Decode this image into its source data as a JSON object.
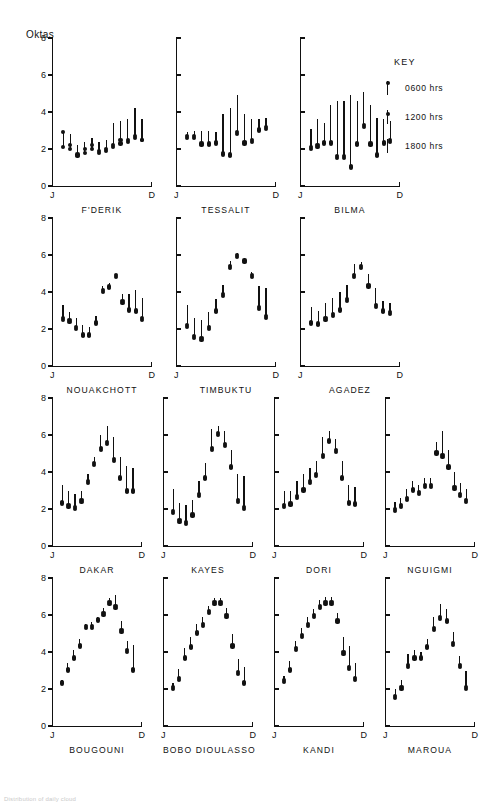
{
  "figure": {
    "y_axis_title": "Oktas",
    "caption": "Distribution of daily cloud"
  },
  "key": {
    "title": "KEY",
    "items": [
      {
        "label": "0600 hrs",
        "marker": "dot-top-of-line",
        "dot_pos": 0.05
      },
      {
        "label": "1200 hrs",
        "marker": "dot-upper-line",
        "dot_pos": 0.22
      },
      {
        "label": "1800 hrs",
        "marker": "plain-line",
        "dot_pos": null
      }
    ]
  },
  "chart_data": {
    "type": "line",
    "ylabel": "Oktas",
    "xlabel": "",
    "ylim": [
      0,
      8
    ],
    "yticks": [
      0,
      2,
      4,
      6,
      8
    ],
    "ytick_labels": [
      "0",
      "2",
      "4",
      "6",
      "8"
    ],
    "xticks": [
      "J",
      "D"
    ],
    "xtick_labels": [
      "J",
      "D"
    ],
    "grid": false,
    "legend_position": "top-right",
    "categories": [
      "J",
      "F",
      "M",
      "A",
      "M",
      "J",
      "J",
      "A",
      "S",
      "O",
      "N",
      "D"
    ],
    "series_names": [
      "0600 hrs",
      "1200 hrs",
      "1800 hrs"
    ],
    "panels": [
      {
        "name": "F'DERIK",
        "row": 0,
        "col": 0,
        "series": [
          {
            "name": "0600 hrs",
            "values": [
              2.9,
              2.0,
              1.6,
              1.8,
              2.0,
              1.8,
              1.9,
              2.1,
              2.3,
              2.4,
              2.6,
              2.5
            ]
          },
          {
            "name": "1200 hrs",
            "values": [
              2.1,
              2.2,
              1.7,
              2.0,
              2.2,
              1.9,
              2.0,
              2.2,
              2.5,
              2.5,
              2.7,
              2.5
            ]
          },
          {
            "name": "1800 hrs",
            "values": [
              3.0,
              2.8,
              2.2,
              2.4,
              2.6,
              2.4,
              2.5,
              3.4,
              3.5,
              3.6,
              4.2,
              3.6
            ]
          }
        ]
      },
      {
        "name": "TESSALIT",
        "row": 0,
        "col": 1,
        "series": [
          {
            "name": "0600 hrs",
            "values": [
              2.6,
              2.6,
              2.2,
              2.2,
              2.3,
              1.7,
              1.6,
              2.8,
              2.3,
              2.4,
              3.0,
              3.1
            ]
          },
          {
            "name": "1200 hrs",
            "values": [
              2.7,
              2.7,
              2.3,
              2.3,
              2.4,
              1.8,
              1.7,
              2.9,
              2.4,
              2.5,
              3.1,
              3.2
            ]
          },
          {
            "name": "1800 hrs",
            "values": [
              2.9,
              3.0,
              3.0,
              3.0,
              2.9,
              3.9,
              4.2,
              4.9,
              3.9,
              3.6,
              3.6,
              3.7
            ]
          }
        ]
      },
      {
        "name": "BILMA",
        "row": 0,
        "col": 2,
        "series": [
          {
            "name": "0600 hrs",
            "values": [
              2.0,
              2.1,
              2.3,
              2.3,
              1.5,
              1.5,
              1.0,
              2.2,
              3.2,
              2.2,
              1.6,
              2.3,
              2.4
            ]
          },
          {
            "name": "1200 hrs",
            "values": [
              2.1,
              2.2,
              2.4,
              2.4,
              1.6,
              1.6,
              1.1,
              2.3,
              3.3,
              2.3,
              1.7,
              2.4,
              2.5
            ]
          },
          {
            "name": "1800 hrs",
            "values": [
              3.1,
              3.6,
              3.4,
              4.4,
              4.6,
              4.6,
              4.9,
              4.6,
              5.1,
              4.4,
              3.7,
              3.6,
              3.5
            ]
          }
        ]
      },
      {
        "name": "NOUAKCHOTT",
        "row": 1,
        "col": 0,
        "series": [
          {
            "name": "0600 hrs",
            "values": [
              2.5,
              2.4,
              2.0,
              1.6,
              1.6,
              2.3,
              4.0,
              4.2,
              4.8,
              3.4,
              3.0,
              2.9,
              2.5
            ]
          },
          {
            "name": "1200 hrs",
            "values": [
              2.6,
              2.5,
              2.1,
              1.7,
              1.7,
              2.4,
              4.1,
              4.3,
              4.9,
              3.5,
              3.1,
              3.0,
              2.6
            ]
          },
          {
            "name": "1800 hrs",
            "values": [
              3.3,
              2.9,
              2.6,
              2.2,
              2.1,
              2.7,
              4.3,
              4.5,
              4.9,
              3.9,
              3.9,
              4.1,
              3.7
            ]
          }
        ]
      },
      {
        "name": "TIMBUKTU",
        "row": 1,
        "col": 1,
        "series": [
          {
            "name": "0600 hrs",
            "values": [
              2.1,
              1.5,
              1.4,
              2.0,
              2.9,
              3.8,
              5.3,
              5.9,
              5.6,
              4.8,
              3.1,
              2.6
            ]
          },
          {
            "name": "1200 hrs",
            "values": [
              2.2,
              1.6,
              1.5,
              2.1,
              3.0,
              3.9,
              5.4,
              6.0,
              5.7,
              4.9,
              3.2,
              2.7
            ]
          },
          {
            "name": "1800 hrs",
            "values": [
              3.3,
              2.6,
              2.5,
              2.9,
              3.6,
              4.4,
              5.7,
              6.1,
              5.8,
              5.1,
              4.3,
              4.2
            ]
          }
        ]
      },
      {
        "name": "AGADEZ",
        "row": 1,
        "col": 2,
        "series": [
          {
            "name": "0600 hrs",
            "values": [
              2.3,
              2.2,
              2.5,
              2.7,
              3.0,
              3.5,
              4.8,
              5.3,
              4.3,
              3.2,
              2.9,
              2.8
            ]
          },
          {
            "name": "1200 hrs",
            "values": [
              2.4,
              2.3,
              2.6,
              2.8,
              3.1,
              3.6,
              4.9,
              5.4,
              4.4,
              3.3,
              3.0,
              2.9
            ]
          },
          {
            "name": "1800 hrs",
            "values": [
              3.2,
              3.0,
              3.4,
              3.7,
              4.0,
              4.4,
              5.5,
              5.6,
              5.0,
              4.2,
              3.5,
              3.4
            ]
          }
        ]
      },
      {
        "name": "DAKAR",
        "row": 2,
        "col": 0,
        "series": [
          {
            "name": "0600 hrs",
            "values": [
              2.3,
              2.1,
              2.0,
              2.4,
              3.4,
              4.4,
              5.2,
              5.5,
              4.6,
              3.6,
              2.9,
              2.9
            ]
          },
          {
            "name": "1200 hrs",
            "values": [
              2.4,
              2.2,
              2.1,
              2.5,
              3.5,
              4.5,
              5.3,
              5.6,
              4.7,
              3.7,
              3.0,
              3.0
            ]
          },
          {
            "name": "1800 hrs",
            "values": [
              3.3,
              3.0,
              2.8,
              3.0,
              3.9,
              4.8,
              6.0,
              6.5,
              5.9,
              4.8,
              4.3,
              4.2
            ]
          }
        ]
      },
      {
        "name": "KAYES",
        "row": 2,
        "col": 1,
        "series": [
          {
            "name": "0600 hrs",
            "values": [
              1.8,
              1.3,
              1.2,
              1.6,
              2.7,
              3.6,
              5.2,
              6.0,
              5.4,
              4.2,
              2.4,
              2.0
            ]
          },
          {
            "name": "1200 hrs",
            "values": [
              1.9,
              1.4,
              1.3,
              1.7,
              2.8,
              3.7,
              5.3,
              6.1,
              5.5,
              4.3,
              2.5,
              2.1
            ]
          },
          {
            "name": "1800 hrs",
            "values": [
              3.1,
              2.3,
              2.2,
              2.5,
              3.5,
              4.5,
              6.3,
              6.5,
              6.2,
              5.2,
              3.9,
              3.8
            ]
          }
        ]
      },
      {
        "name": "DORI",
        "row": 2,
        "col": 2,
        "series": [
          {
            "name": "0600 hrs",
            "values": [
              2.1,
              2.2,
              2.6,
              3.0,
              3.4,
              3.8,
              4.8,
              5.6,
              5.1,
              3.6,
              2.3,
              2.2
            ]
          },
          {
            "name": "1200 hrs",
            "values": [
              2.2,
              2.3,
              2.7,
              3.1,
              3.5,
              3.9,
              4.9,
              5.7,
              5.2,
              3.7,
              2.4,
              2.3
            ]
          },
          {
            "name": "1800 hrs",
            "values": [
              3.0,
              3.0,
              3.5,
              3.9,
              4.2,
              4.6,
              5.9,
              6.2,
              5.8,
              4.6,
              3.3,
              3.2
            ]
          }
        ]
      },
      {
        "name": "NGUIGMI",
        "row": 2,
        "col": 3,
        "series": [
          {
            "name": "0600 hrs",
            "values": [
              1.9,
              2.1,
              2.5,
              3.0,
              2.8,
              3.2,
              3.2,
              5.0,
              4.8,
              4.2,
              3.1,
              2.7,
              2.4
            ]
          },
          {
            "name": "1200 hrs",
            "values": [
              2.0,
              2.2,
              2.6,
              3.1,
              2.9,
              3.3,
              3.3,
              5.1,
              4.9,
              4.3,
              3.2,
              2.8,
              2.5
            ]
          },
          {
            "name": "1800 hrs",
            "values": [
              2.4,
              2.6,
              3.1,
              3.5,
              3.3,
              3.7,
              3.7,
              5.6,
              6.2,
              5.2,
              4.0,
              3.4,
              3.1
            ]
          }
        ]
      },
      {
        "name": "BOUGOUNI",
        "row": 3,
        "col": 0,
        "series": [
          {
            "name": "0600 hrs",
            "values": [
              2.3,
              3.0,
              3.6,
              4.3,
              5.3,
              5.3,
              5.7,
              6.0,
              6.6,
              6.4,
              5.1,
              4.0,
              3.0
            ]
          },
          {
            "name": "1200 hrs",
            "values": [
              2.4,
              3.1,
              3.7,
              4.4,
              5.4,
              5.4,
              5.8,
              6.1,
              6.7,
              6.5,
              5.2,
              4.1,
              3.1
            ]
          },
          {
            "name": "1800 hrs",
            "values": [
              2.5,
              3.4,
              4.1,
              4.7,
              5.5,
              5.6,
              5.9,
              6.4,
              6.9,
              7.1,
              5.7,
              4.6,
              4.4
            ]
          }
        ]
      },
      {
        "name": "BOBO DIOULASSO",
        "row": 3,
        "col": 1,
        "series": [
          {
            "name": "0600 hrs",
            "values": [
              2.0,
              2.5,
              3.6,
              4.2,
              5.0,
              5.4,
              6.1,
              6.6,
              6.6,
              5.9,
              4.3,
              2.8,
              2.3
            ]
          },
          {
            "name": "1200 hrs",
            "values": [
              2.1,
              2.6,
              3.7,
              4.3,
              5.1,
              5.5,
              6.2,
              6.7,
              6.7,
              6.0,
              4.4,
              2.9,
              2.4
            ]
          },
          {
            "name": "1800 hrs",
            "values": [
              2.3,
              3.1,
              4.2,
              4.8,
              5.5,
              5.9,
              6.5,
              6.9,
              6.9,
              6.4,
              5.0,
              3.6,
              3.2
            ]
          }
        ]
      },
      {
        "name": "KANDI",
        "row": 3,
        "col": 2,
        "series": [
          {
            "name": "0600 hrs",
            "values": [
              2.4,
              3.0,
              4.1,
              4.8,
              5.4,
              5.9,
              6.4,
              6.6,
              6.6,
              5.6,
              3.9,
              3.1,
              2.5
            ]
          },
          {
            "name": "1200 hrs",
            "values": [
              2.5,
              3.1,
              4.2,
              4.9,
              5.5,
              6.0,
              6.5,
              6.7,
              6.7,
              5.7,
              4.0,
              3.2,
              2.6
            ]
          },
          {
            "name": "1800 hrs",
            "values": [
              2.7,
              3.5,
              4.6,
              5.3,
              5.9,
              6.3,
              6.8,
              7.0,
              7.0,
              6.1,
              4.8,
              4.3,
              3.4
            ]
          }
        ]
      },
      {
        "name": "MAROUA",
        "row": 3,
        "col": 3,
        "series": [
          {
            "name": "0600 hrs",
            "values": [
              1.5,
              2.0,
              3.2,
              3.6,
              3.6,
              4.2,
              5.2,
              5.8,
              5.6,
              4.4,
              3.2,
              2.0
            ]
          },
          {
            "name": "1200 hrs",
            "values": [
              1.6,
              2.1,
              3.3,
              3.7,
              3.7,
              4.3,
              5.3,
              5.9,
              5.7,
              4.5,
              3.3,
              2.1
            ]
          },
          {
            "name": "1800 hrs",
            "values": [
              2.0,
              2.5,
              3.9,
              4.1,
              4.0,
              4.7,
              5.9,
              6.6,
              6.3,
              5.1,
              3.8,
              3.0
            ]
          }
        ]
      }
    ]
  }
}
